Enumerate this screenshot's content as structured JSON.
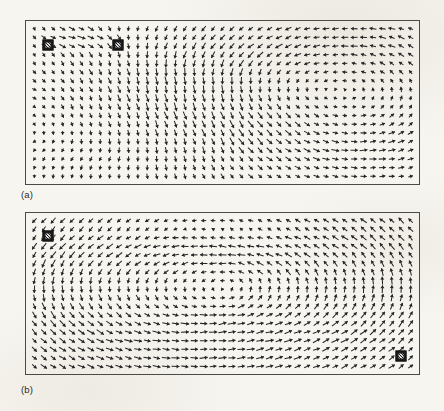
{
  "figure": {
    "type": "vector-field-pair",
    "background_color": "#f7f5f0",
    "arrow_color": "#262626",
    "frame_color": "#4a4a48",
    "marker_color": "#1c1c1c"
  },
  "panels": [
    {
      "id": "a",
      "caption": "(a)",
      "frame": {
        "x": 25,
        "y": 20,
        "width": 395,
        "height": 165
      },
      "caption_pos": {
        "x": 21,
        "y": 190
      },
      "grid": {
        "cols": 41,
        "rows": 18
      },
      "markers": [
        {
          "name": "marker-source",
          "gx": 1.4,
          "gy": 1.9
        },
        {
          "name": "marker-sink",
          "gx": 8.9,
          "gy": 1.9
        }
      ],
      "flow": {
        "description": "Rightward jet along upper-left between the two square markers; a large clockwise recirculating vortex fills the right half of the cavity and a weaker counter-rotating cell occupies the lower left.",
        "vortices": [
          {
            "name": "primary-vortex-right",
            "cx": 0.8,
            "cy": 0.46,
            "strength": 1.0,
            "sense": "clockwise",
            "radius": 0.34
          },
          {
            "name": "secondary-vortex-left",
            "cx": 0.25,
            "cy": 0.58,
            "strength": 0.55,
            "sense": "counter-clockwise",
            "radius": 0.28
          },
          {
            "name": "mid-cell",
            "cx": 0.5,
            "cy": 0.4,
            "strength": 0.35,
            "sense": "clockwise",
            "radius": 0.22
          }
        ],
        "jet": {
          "y": 0.11,
          "x0": 0.04,
          "x1": 0.24,
          "strength": 1.25,
          "direction": "right"
        }
      }
    },
    {
      "id": "b",
      "caption": "(b)",
      "frame": {
        "x": 25,
        "y": 212,
        "width": 395,
        "height": 163
      },
      "caption_pos": {
        "x": 21,
        "y": 385
      },
      "grid": {
        "cols": 41,
        "rows": 18
      },
      "markers": [
        {
          "name": "marker-source",
          "gx": 1.4,
          "gy": 1.8
        },
        {
          "name": "marker-sink",
          "gx": 39.0,
          "gy": 15.8
        }
      ],
      "flow": {
        "description": "Rightward stream along the top from the upper-left marker, turning down on the right and returning leftward along the bottom toward a broad vortex at left-of-centre; flow converges into the lower-right square marker.",
        "vortices": [
          {
            "name": "primary-vortex-left",
            "cx": 0.26,
            "cy": 0.46,
            "strength": 1.0,
            "sense": "clockwise",
            "radius": 0.33
          },
          {
            "name": "secondary-vortex-right",
            "cx": 0.78,
            "cy": 0.44,
            "strength": 0.75,
            "sense": "clockwise",
            "radius": 0.3
          },
          {
            "name": "mid-cell",
            "cx": 0.52,
            "cy": 0.5,
            "strength": 0.3,
            "sense": "clockwise",
            "radius": 0.2
          }
        ],
        "jet": {
          "y": 0.1,
          "x0": 0.05,
          "x1": 0.8,
          "strength": 1.1,
          "direction": "right"
        }
      }
    }
  ]
}
